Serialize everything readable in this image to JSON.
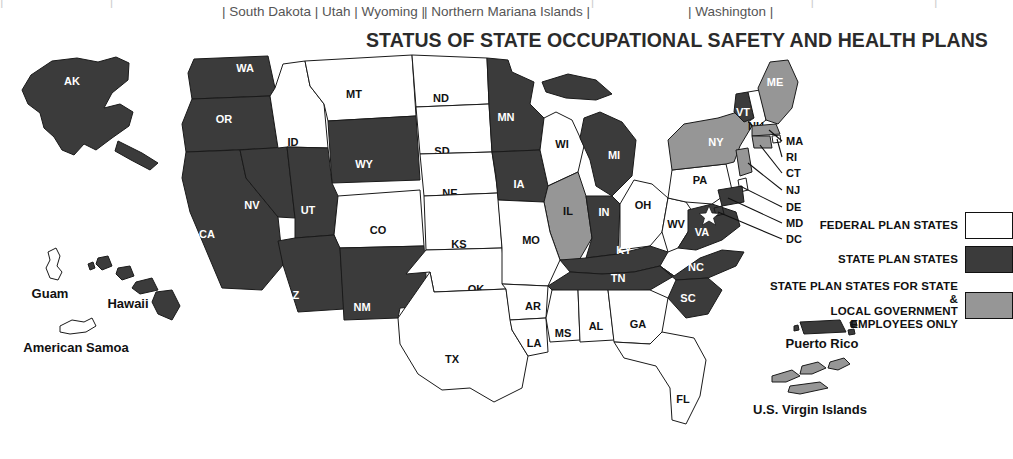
{
  "top_strip": {
    "segment_1": "| South Dakota | Utah | Wyoming |",
    "segment_2": "| Northern Mariana Islands |",
    "segment_3": "| Washington |"
  },
  "title": "STATUS OF STATE OCCUPATIONAL SAFETY AND HEALTH PLANS",
  "legend": {
    "federal_label": "FEDERAL PLAN STATES",
    "plan_label": "STATE PLAN STATES",
    "local_label_line1": "STATE PLAN STATES FOR STATE &",
    "local_label_line2": "LOCAL GOVERNMENT EMPLOYEES ONLY",
    "colors": {
      "federal": "#ffffff",
      "state_plan": "#3b3b3b",
      "state_local": "#969696",
      "outline": "#111111"
    }
  },
  "map": {
    "state_labels": {
      "AK": "AK",
      "WA": "WA",
      "OR": "OR",
      "CA": "CA",
      "NV": "NV",
      "ID": "ID",
      "MT": "MT",
      "WY": "WY",
      "UT": "UT",
      "AZ": "AZ",
      "NM": "NM",
      "CO": "CO",
      "ND": "ND",
      "SD": "SD",
      "NE": "NE",
      "KS": "KS",
      "OK": "OK",
      "TX": "TX",
      "MN": "MN",
      "IA": "IA",
      "MO": "MO",
      "AR": "AR",
      "LA": "LA",
      "WI": "WI",
      "IL": "IL",
      "MI": "MI",
      "IN": "IN",
      "OH": "OH",
      "KY": "KY",
      "TN": "TN",
      "MS": "MS",
      "AL": "AL",
      "GA": "GA",
      "FL": "FL",
      "SC": "SC",
      "NC": "NC",
      "VA": "VA",
      "WV": "WV",
      "PA": "PA",
      "NY": "NY",
      "VT": "VT",
      "NH": "NH",
      "ME": "ME"
    },
    "callouts": [
      "MA",
      "RI",
      "CT",
      "NJ",
      "DE",
      "MD",
      "DC"
    ],
    "territories": {
      "guam": "Guam",
      "hawaii": "Hawaii",
      "american_samoa": "American Samoa",
      "puerto_rico": "Puerto Rico",
      "virgin_islands": "U.S. Virgin Islands"
    },
    "status": {
      "state_plan": [
        "AK",
        "WA",
        "OR",
        "CA",
        "NV",
        "UT",
        "WY",
        "AZ",
        "NM",
        "MN",
        "IA",
        "MI",
        "IN",
        "KY",
        "TN",
        "NC",
        "SC",
        "VA",
        "VT",
        "HI",
        "PR",
        "MD"
      ],
      "state_local": [
        "IL",
        "NY",
        "ME",
        "NJ",
        "CT",
        "VI"
      ],
      "federal": [
        "ID",
        "MT",
        "ND",
        "SD",
        "NE",
        "KS",
        "CO",
        "OK",
        "TX",
        "MO",
        "AR",
        "LA",
        "MS",
        "AL",
        "GA",
        "FL",
        "WI",
        "OH",
        "WV",
        "PA",
        "NH",
        "DE",
        "MA",
        "RI",
        "GU",
        "AS"
      ]
    },
    "capital_marker": "star-marker"
  }
}
